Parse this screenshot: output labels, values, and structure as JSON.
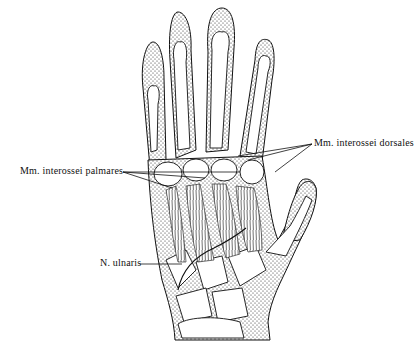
{
  "figure": {
    "labels": {
      "dorsal": "Mm. interossei dorsales",
      "palmar": "Mm. interossei palmares",
      "nerve": "N. ulnaris"
    }
  }
}
